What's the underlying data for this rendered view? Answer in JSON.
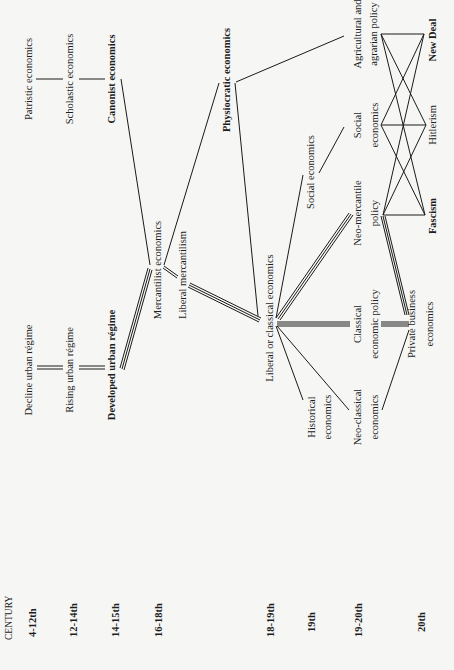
{
  "centuries": {
    "header": "CENTURY",
    "items": [
      "4-12th",
      "12-14th",
      "14-15th",
      "16-18th",
      "18-19th",
      "19th",
      "19-20th",
      "20th"
    ]
  },
  "nodes": {
    "patristic": "Patristic economics",
    "scholastic": "Scholastic economics",
    "canonist": "Canonist economics",
    "decline_urban": "Decline urban régime",
    "rising_urban": "Rising urban régime",
    "developed_urban": "Developed urban régime",
    "mercantilist": "Mercantilist economics",
    "liberal_mercantilism": "Liberal mercantilism",
    "physiocratic": "Physiocratic economics",
    "liberal_classical": "Liberal or classical economics",
    "social_economics_19": "Social economics",
    "historical_l1": "Historical",
    "historical_l2": "economics",
    "neo_mercantile_l1": "Neo-mercantile",
    "neo_mercantile_l2": "policy",
    "classical_policy_l1": "Classical",
    "classical_policy_l2": "economic policy",
    "neo_classical_l1": "Neo-classical",
    "neo_classical_l2": "economics",
    "social_economics_l1": "Social",
    "social_economics_l2": "economics",
    "agricultural_l1": "Agricultural and",
    "agricultural_l2": "agrarian policy",
    "private_business_l1": "Private business",
    "private_business_l2": "economics",
    "new_deal": "New Deal",
    "hitlerism": "Hitlerism",
    "fascism": "Fascism"
  },
  "edges": [
    {
      "from": "patristic",
      "to": "scholastic",
      "style": "single"
    },
    {
      "from": "scholastic",
      "to": "canonist",
      "style": "single"
    },
    {
      "from": "canonist",
      "to": "mercantilist",
      "style": "single"
    },
    {
      "from": "decline_urban",
      "to": "rising_urban",
      "style": "double"
    },
    {
      "from": "rising_urban",
      "to": "developed_urban",
      "style": "double"
    },
    {
      "from": "developed_urban",
      "to": "mercantilist",
      "style": "triple"
    },
    {
      "from": "mercantilist",
      "to": "physiocratic",
      "style": "single"
    },
    {
      "from": "mercantilist",
      "to": "liberal_mercantilism",
      "style": "double"
    },
    {
      "from": "liberal_mercantilism",
      "to": "liberal_classical",
      "style": "triple"
    },
    {
      "from": "physiocratic",
      "to": "liberal_classical",
      "style": "single"
    },
    {
      "from": "physiocratic",
      "to": "agricultural",
      "style": "single"
    },
    {
      "from": "liberal_classical",
      "to": "social_economics_19",
      "style": "single"
    },
    {
      "from": "liberal_classical",
      "to": "neo_mercantile",
      "style": "triple"
    },
    {
      "from": "liberal_classical",
      "to": "classical_policy",
      "style": "triple"
    },
    {
      "from": "liberal_classical",
      "to": "historical",
      "style": "single"
    },
    {
      "from": "liberal_classical",
      "to": "neo_classical",
      "style": "single"
    },
    {
      "from": "social_economics_19",
      "to": "social_economics",
      "style": "single"
    },
    {
      "from": "classical_policy",
      "to": "private_business",
      "style": "triple"
    },
    {
      "from": "neo_mercantile",
      "to": "private_business",
      "style": "triple"
    },
    {
      "from": "neo_classical",
      "to": "private_business",
      "style": "single"
    },
    {
      "from": "agricultural",
      "to": "new_deal",
      "style": "single"
    },
    {
      "from": "agricultural",
      "to": "hitlerism",
      "style": "single"
    },
    {
      "from": "agricultural",
      "to": "fascism",
      "style": "single"
    },
    {
      "from": "social_economics",
      "to": "new_deal",
      "style": "single"
    },
    {
      "from": "social_economics",
      "to": "hitlerism",
      "style": "single"
    },
    {
      "from": "social_economics",
      "to": "fascism",
      "style": "single"
    },
    {
      "from": "neo_mercantile",
      "to": "new_deal",
      "style": "single"
    },
    {
      "from": "neo_mercantile",
      "to": "hitlerism",
      "style": "single"
    },
    {
      "from": "neo_mercantile",
      "to": "fascism",
      "style": "single"
    }
  ]
}
